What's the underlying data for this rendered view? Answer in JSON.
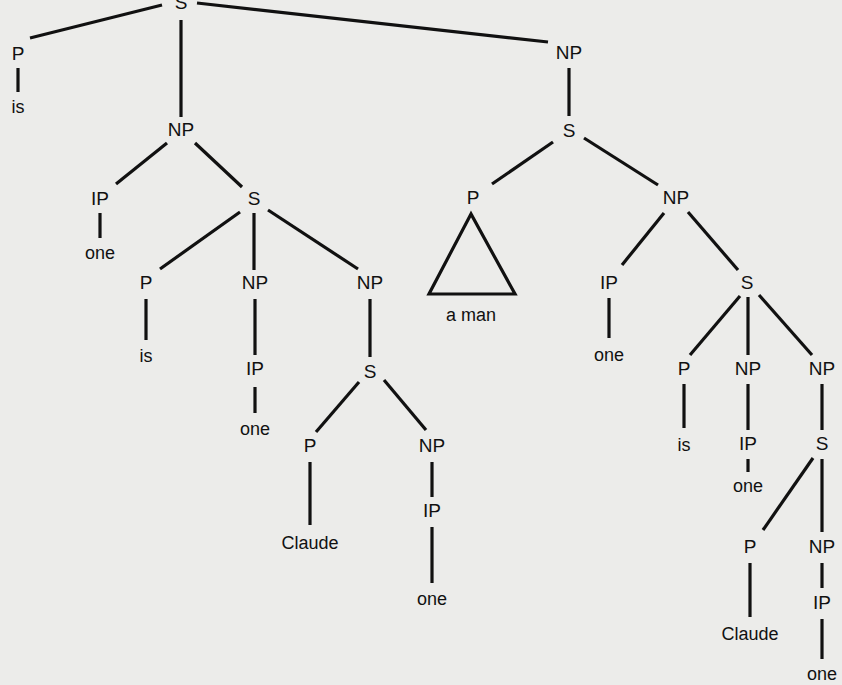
{
  "diagram": {
    "background": "#ececea",
    "ink": "#111111",
    "nodes": [
      {
        "id": "s0",
        "label": "S",
        "x": 181,
        "y": 4,
        "type": "node"
      },
      {
        "id": "p0",
        "label": "P",
        "x": 18,
        "y": 55,
        "type": "node"
      },
      {
        "id": "is0",
        "label": "is",
        "x": 18,
        "y": 108,
        "type": "leaf"
      },
      {
        "id": "np0",
        "label": "NP",
        "x": 181,
        "y": 131,
        "type": "node"
      },
      {
        "id": "ip0",
        "label": "IP",
        "x": 100,
        "y": 200,
        "type": "node"
      },
      {
        "id": "one0",
        "label": "one",
        "x": 100,
        "y": 254,
        "type": "leaf"
      },
      {
        "id": "s1",
        "label": "S",
        "x": 254,
        "y": 200,
        "type": "node"
      },
      {
        "id": "p1",
        "label": "P",
        "x": 146,
        "y": 284,
        "type": "node"
      },
      {
        "id": "is1",
        "label": "is",
        "x": 146,
        "y": 357,
        "type": "leaf"
      },
      {
        "id": "np1",
        "label": "NP",
        "x": 255,
        "y": 284,
        "type": "node"
      },
      {
        "id": "ip1",
        "label": "IP",
        "x": 255,
        "y": 370,
        "type": "node"
      },
      {
        "id": "one1",
        "label": "one",
        "x": 255,
        "y": 430,
        "type": "leaf"
      },
      {
        "id": "np2",
        "label": "NP",
        "x": 370,
        "y": 284,
        "type": "node"
      },
      {
        "id": "s2",
        "label": "S",
        "x": 370,
        "y": 373,
        "type": "node"
      },
      {
        "id": "p2",
        "label": "P",
        "x": 310,
        "y": 447,
        "type": "node"
      },
      {
        "id": "cl0",
        "label": "Claude",
        "x": 310,
        "y": 544,
        "type": "leaf"
      },
      {
        "id": "np3",
        "label": "NP",
        "x": 432,
        "y": 447,
        "type": "node"
      },
      {
        "id": "ip2",
        "label": "IP",
        "x": 432,
        "y": 512,
        "type": "node"
      },
      {
        "id": "one2",
        "label": "one",
        "x": 432,
        "y": 600,
        "type": "leaf"
      },
      {
        "id": "np4",
        "label": "NP",
        "x": 569,
        "y": 54,
        "type": "node"
      },
      {
        "id": "s3",
        "label": "S",
        "x": 569,
        "y": 132,
        "type": "node"
      },
      {
        "id": "p3",
        "label": "P",
        "x": 473,
        "y": 199,
        "type": "node"
      },
      {
        "id": "aman",
        "label": "a man",
        "x": 471,
        "y": 316,
        "type": "leaf"
      },
      {
        "id": "np5",
        "label": "NP",
        "x": 676,
        "y": 199,
        "type": "node"
      },
      {
        "id": "ip3",
        "label": "IP",
        "x": 609,
        "y": 284,
        "type": "node"
      },
      {
        "id": "one3",
        "label": "one",
        "x": 609,
        "y": 356,
        "type": "leaf"
      },
      {
        "id": "s4",
        "label": "S",
        "x": 747,
        "y": 284,
        "type": "node"
      },
      {
        "id": "p4",
        "label": "P",
        "x": 684,
        "y": 370,
        "type": "node"
      },
      {
        "id": "is2",
        "label": "is",
        "x": 684,
        "y": 446,
        "type": "leaf"
      },
      {
        "id": "np6",
        "label": "NP",
        "x": 748,
        "y": 370,
        "type": "node"
      },
      {
        "id": "ip4",
        "label": "IP",
        "x": 748,
        "y": 445,
        "type": "node"
      },
      {
        "id": "one4",
        "label": "one",
        "x": 748,
        "y": 487,
        "type": "leaf"
      },
      {
        "id": "np7",
        "label": "NP",
        "x": 822,
        "y": 370,
        "type": "node"
      },
      {
        "id": "s5",
        "label": "S",
        "x": 822,
        "y": 445,
        "type": "node"
      },
      {
        "id": "p5",
        "label": "P",
        "x": 750,
        "y": 548,
        "type": "node"
      },
      {
        "id": "cl1",
        "label": "Claude",
        "x": 750,
        "y": 635,
        "type": "leaf"
      },
      {
        "id": "np8",
        "label": "NP",
        "x": 822,
        "y": 548,
        "type": "node"
      },
      {
        "id": "ip5",
        "label": "IP",
        "x": 822,
        "y": 604,
        "type": "node"
      },
      {
        "id": "one5",
        "label": "one",
        "x": 822,
        "y": 675,
        "type": "leaf"
      }
    ],
    "edges": [
      {
        "x1": 162,
        "y1": 5,
        "x2": 30,
        "y2": 38
      },
      {
        "x1": 181,
        "y1": 20,
        "x2": 181,
        "y2": 117
      },
      {
        "x1": 197,
        "y1": 3,
        "x2": 548,
        "y2": 42
      },
      {
        "x1": 18,
        "y1": 68,
        "x2": 18,
        "y2": 92
      },
      {
        "x1": 167,
        "y1": 143,
        "x2": 116,
        "y2": 184
      },
      {
        "x1": 195,
        "y1": 143,
        "x2": 242,
        "y2": 187
      },
      {
        "x1": 100,
        "y1": 213,
        "x2": 100,
        "y2": 238
      },
      {
        "x1": 240,
        "y1": 212,
        "x2": 160,
        "y2": 269
      },
      {
        "x1": 254,
        "y1": 213,
        "x2": 254,
        "y2": 270
      },
      {
        "x1": 268,
        "y1": 210,
        "x2": 358,
        "y2": 269
      },
      {
        "x1": 146,
        "y1": 299,
        "x2": 146,
        "y2": 340
      },
      {
        "x1": 255,
        "y1": 299,
        "x2": 255,
        "y2": 355
      },
      {
        "x1": 255,
        "y1": 387,
        "x2": 255,
        "y2": 413
      },
      {
        "x1": 370,
        "y1": 299,
        "x2": 370,
        "y2": 357
      },
      {
        "x1": 359,
        "y1": 382,
        "x2": 316,
        "y2": 432
      },
      {
        "x1": 384,
        "y1": 380,
        "x2": 426,
        "y2": 430
      },
      {
        "x1": 310,
        "y1": 462,
        "x2": 310,
        "y2": 525
      },
      {
        "x1": 432,
        "y1": 462,
        "x2": 432,
        "y2": 497
      },
      {
        "x1": 432,
        "y1": 527,
        "x2": 432,
        "y2": 583
      },
      {
        "x1": 569,
        "y1": 68,
        "x2": 569,
        "y2": 116
      },
      {
        "x1": 553,
        "y1": 142,
        "x2": 492,
        "y2": 184
      },
      {
        "x1": 584,
        "y1": 138,
        "x2": 658,
        "y2": 185
      },
      {
        "x1": 664,
        "y1": 213,
        "x2": 622,
        "y2": 265
      },
      {
        "x1": 688,
        "y1": 212,
        "x2": 738,
        "y2": 270
      },
      {
        "x1": 609,
        "y1": 298,
        "x2": 609,
        "y2": 338
      },
      {
        "x1": 740,
        "y1": 296,
        "x2": 690,
        "y2": 355
      },
      {
        "x1": 748,
        "y1": 297,
        "x2": 748,
        "y2": 355
      },
      {
        "x1": 759,
        "y1": 295,
        "x2": 812,
        "y2": 355
      },
      {
        "x1": 684,
        "y1": 384,
        "x2": 684,
        "y2": 428
      },
      {
        "x1": 748,
        "y1": 384,
        "x2": 748,
        "y2": 430
      },
      {
        "x1": 748,
        "y1": 459,
        "x2": 748,
        "y2": 472
      },
      {
        "x1": 822,
        "y1": 384,
        "x2": 822,
        "y2": 430
      },
      {
        "x1": 813,
        "y1": 458,
        "x2": 763,
        "y2": 530
      },
      {
        "x1": 822,
        "y1": 459,
        "x2": 822,
        "y2": 532
      },
      {
        "x1": 750,
        "y1": 563,
        "x2": 750,
        "y2": 617
      },
      {
        "x1": 822,
        "y1": 563,
        "x2": 822,
        "y2": 588
      },
      {
        "x1": 822,
        "y1": 619,
        "x2": 822,
        "y2": 659
      }
    ],
    "triangles": [
      {
        "points": "471,214 429,294 515,294",
        "under": "p3"
      }
    ]
  }
}
